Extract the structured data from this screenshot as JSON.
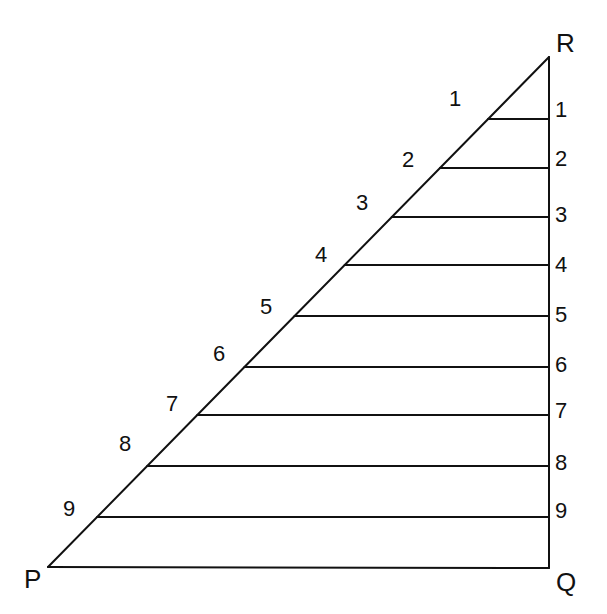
{
  "diagram": {
    "type": "right-triangle-subdivision",
    "vertices": {
      "P": {
        "label": "P",
        "x": 48,
        "y": 567
      },
      "Q": {
        "label": "Q",
        "x": 549,
        "y": 568
      },
      "R": {
        "label": "R",
        "x": 549,
        "y": 57
      }
    },
    "stroke_color": "#111111",
    "divisions": [
      {
        "index": 1,
        "left_label": "1",
        "right_label": "1",
        "y": 119
      },
      {
        "index": 2,
        "left_label": "2",
        "right_label": "2",
        "y": 168
      },
      {
        "index": 3,
        "left_label": "3",
        "right_label": "3",
        "y": 217
      },
      {
        "index": 4,
        "left_label": "4",
        "right_label": "4",
        "y": 265
      },
      {
        "index": 5,
        "left_label": "5",
        "right_label": "5",
        "y": 316
      },
      {
        "index": 6,
        "left_label": "6",
        "right_label": "6",
        "y": 367
      },
      {
        "index": 7,
        "left_label": "7",
        "right_label": "7",
        "y": 415
      },
      {
        "index": 8,
        "left_label": "8",
        "right_label": "8",
        "y": 466
      },
      {
        "index": 9,
        "left_label": "9",
        "right_label": "9",
        "y": 517
      }
    ]
  }
}
